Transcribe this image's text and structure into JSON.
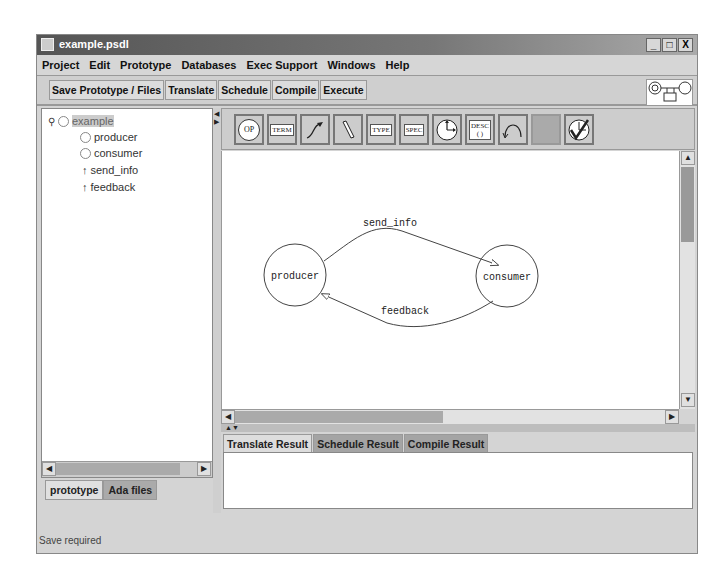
{
  "window": {
    "title": "example.psdl",
    "controls": [
      "_",
      "□",
      "X"
    ]
  },
  "menubar": {
    "items": [
      "Project",
      "Edit",
      "Prototype",
      "Databases",
      "Exec Support",
      "Windows",
      "Help"
    ]
  },
  "toolbar": {
    "buttons": [
      "Save Prototype / Files",
      "Translate",
      "Schedule",
      "Compile",
      "Execute"
    ]
  },
  "tree": {
    "root": "example",
    "children": [
      {
        "label": "producer",
        "icon": "operator-circle-icon"
      },
      {
        "label": "consumer",
        "icon": "operator-circle-icon"
      },
      {
        "label": "send_info",
        "icon": "stream-arrow-icon"
      },
      {
        "label": "feedback",
        "icon": "stream-arrow-icon"
      }
    ]
  },
  "left_tabs": [
    "prototype",
    "Ada files"
  ],
  "palette": {
    "buttons": [
      {
        "name": "op",
        "label": "OP"
      },
      {
        "name": "term",
        "label": "TERM"
      },
      {
        "name": "stream",
        "label": ""
      },
      {
        "name": "pencil",
        "label": ""
      },
      {
        "name": "type",
        "label": "TYPE"
      },
      {
        "name": "spec",
        "label": "SPEC"
      },
      {
        "name": "timer",
        "label": ""
      },
      {
        "name": "desc",
        "label": "DESC\n( )"
      },
      {
        "name": "self-loop",
        "label": ""
      },
      {
        "name": "disabled",
        "label": ""
      },
      {
        "name": "check-timer",
        "label": ""
      }
    ]
  },
  "diagram": {
    "nodes": [
      {
        "id": "producer",
        "label": "producer"
      },
      {
        "id": "consumer",
        "label": "consumer"
      }
    ],
    "edges": [
      {
        "from": "producer",
        "to": "consumer",
        "label": "send_info"
      },
      {
        "from": "consumer",
        "to": "producer",
        "label": "feedback"
      }
    ]
  },
  "result_tabs": [
    "Translate Result",
    "Schedule Result",
    "Compile Result"
  ],
  "status": {
    "text": "Save required"
  }
}
